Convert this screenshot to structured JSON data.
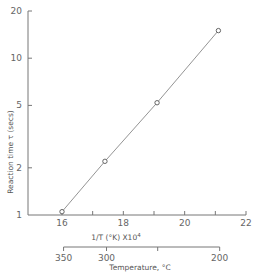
{
  "chart_data": {
    "type": "line",
    "title": "",
    "xlabel": "1/T (°K) X10⁴",
    "ylabel": "Reaction time τ (secs)",
    "secondary_xlabel": "Temperature, °C",
    "yscale": "log",
    "xlim": [
      16,
      22
    ],
    "ylim": [
      1,
      20
    ],
    "grid": false,
    "legend": null,
    "x_ticks": [
      16,
      17,
      18,
      19,
      20,
      21,
      22
    ],
    "x_tick_labels": [
      "16",
      "",
      "18",
      "",
      "20",
      "",
      "22"
    ],
    "y_ticks": [
      1,
      2,
      5,
      10,
      20
    ],
    "y_tick_labels": [
      "1",
      "2",
      "5",
      "10",
      "20"
    ],
    "secondary_x_ticks": [
      350,
      300,
      250,
      200
    ],
    "secondary_x_tick_labels": [
      "350",
      "300",
      "",
      "200"
    ],
    "series": [
      {
        "name": "Reaction time",
        "marker": "open-circle",
        "x": [
          16.0,
          17.4,
          19.1,
          21.1
        ],
        "y": [
          1.05,
          2.2,
          5.2,
          15
        ]
      }
    ]
  },
  "labels": {
    "y_title": "Reaction time τ (secs)",
    "x_title_main": "1/T (°K) X10",
    "x_title_exp": "4",
    "temp_title": "Temperature, °C"
  }
}
